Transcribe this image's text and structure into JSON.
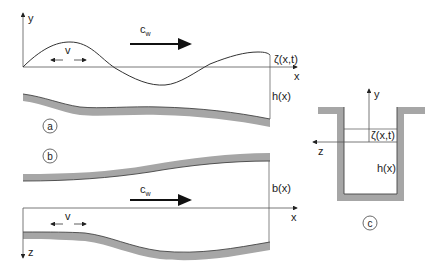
{
  "panels": {
    "a": {
      "marker": "a",
      "axis_y_label": "y",
      "axis_x_label": "x",
      "velocity_label": "v",
      "wave_speed_label": "c",
      "wave_speed_sub": "w",
      "surface_label": "ζ(x,t)",
      "depth_label": "h(x)"
    },
    "b": {
      "marker": "b",
      "axis_x_label": "x",
      "axis_z_label": "z",
      "velocity_label": "v",
      "wave_speed_label": "c",
      "wave_speed_sub": "w",
      "width_label": "b(x)"
    },
    "c": {
      "marker": "c",
      "axis_y_label": "y",
      "axis_z_label": "z",
      "surface_label": "ζ(x,t)",
      "depth_label": "h(x)"
    }
  },
  "colors": {
    "line": "#333333",
    "wall": "#a6a6a6",
    "wall_edge": "#555555",
    "text": "#222222"
  }
}
